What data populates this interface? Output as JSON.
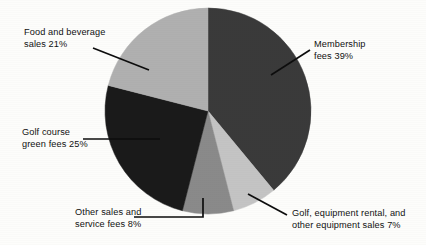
{
  "chart_data": {
    "type": "pie",
    "title": "",
    "legend_position": "callout-labels",
    "categories": [
      "Membership fees",
      "Golf, equipment rental, and other equipment sales",
      "Other sales and service fees",
      "Golf course green fees",
      "Food and beverage sales"
    ],
    "values": [
      39,
      7,
      8,
      25,
      21
    ],
    "unit": "%",
    "colors": [
      "#3a3a3a",
      "#c4c4c4",
      "#8a8a8a",
      "#1a1a1a",
      "#b0b0b0"
    ],
    "start_angle_deg": 0,
    "direction": "clockwise",
    "labels": [
      {
        "id": "membership-fees",
        "text": "Membership\nfees 39%",
        "value": 39
      },
      {
        "id": "golf-equipment-rental",
        "text": "Golf, equipment rental, and\nother equipment sales 7%",
        "value": 7
      },
      {
        "id": "other-sales-service-fees",
        "text": "Other sales and\nservice fees 8%",
        "value": 8
      },
      {
        "id": "golf-course-green-fees",
        "text": "Golf course\ngreen fees 25%",
        "value": 25
      },
      {
        "id": "food-and-beverage-sales",
        "text": "Food and beverage\nsales 21%",
        "value": 21
      }
    ]
  },
  "labels": {
    "food_beverage": "Food and beverage\nsales 21%",
    "golf_course_green_fees": "Golf course\ngreen fees 25%",
    "other_sales_service": "Other sales and\nservice fees 8%",
    "membership_fees": "Membership\nfees 39%",
    "golf_equipment": "Golf, equipment rental, and\nother equipment sales 7%"
  }
}
